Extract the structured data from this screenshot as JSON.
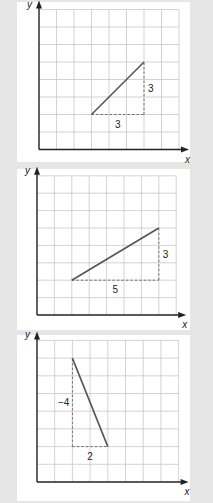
{
  "chart_data": [
    {
      "type": "line",
      "title": "",
      "xlabel": "x",
      "ylabel": "y",
      "grid": true,
      "grid_cols": 8,
      "grid_rows": 8,
      "segment": {
        "from": [
          3,
          2
        ],
        "to": [
          6,
          5
        ]
      },
      "run_label": "3",
      "rise_label": "3",
      "rise_label_side": "right"
    },
    {
      "type": "line",
      "title": "",
      "xlabel": "x",
      "ylabel": "y",
      "grid": true,
      "grid_cols": 8,
      "grid_rows": 8,
      "segment": {
        "from": [
          2,
          2
        ],
        "to": [
          7,
          5
        ]
      },
      "run_label": "5",
      "rise_label": "3",
      "rise_label_side": "right"
    },
    {
      "type": "line",
      "title": "",
      "xlabel": "x",
      "ylabel": "y",
      "grid": true,
      "grid_cols": 8,
      "grid_rows": 8,
      "segment": {
        "from": [
          2,
          7
        ],
        "to": [
          4,
          2
        ]
      },
      "run_label": "2",
      "rise_label": "−4",
      "rise_label_side": "left"
    }
  ],
  "panels": [
    {
      "top": 2,
      "height": 160,
      "origin": [
        22,
        147.5
      ],
      "step": 17.5
    },
    {
      "top": 169,
      "height": 161,
      "origin": [
        20,
        146
      ],
      "step": 17.4
    },
    {
      "top": 335,
      "height": 166,
      "origin": [
        20,
        147
      ],
      "step": 17.7
    }
  ]
}
